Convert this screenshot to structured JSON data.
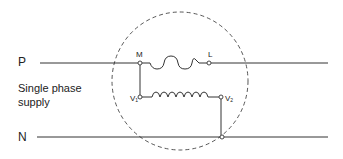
{
  "diagram": {
    "supply_label": "Single phase supply",
    "supply_label_lines": [
      "Single phase",
      "supply"
    ],
    "lines": {
      "phase": "P",
      "neutral": "N"
    },
    "nodes": {
      "main_start": "M",
      "main_end": "L",
      "voltage_start": "V",
      "voltage_start_sub": "1",
      "voltage_end": "V",
      "voltage_end_sub": "2"
    },
    "components": [
      {
        "name": "current-coil",
        "between": [
          "M",
          "L"
        ],
        "turns": 3
      },
      {
        "name": "voltage-coil",
        "between": [
          "V1",
          "V2"
        ],
        "turns": 7
      }
    ],
    "boundary": "dashed-circle",
    "colors": {
      "line": "#333333",
      "text": "#222222",
      "background": "#ffffff"
    }
  }
}
